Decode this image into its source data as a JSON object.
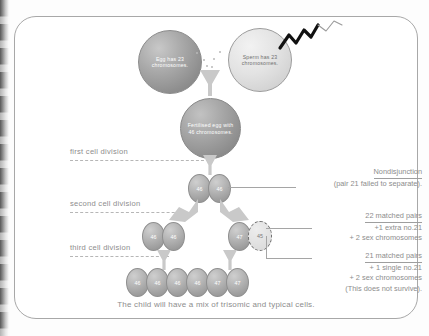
{
  "diagram": {
    "caption": "The child will have a mix of trisomic and typical cells.",
    "gametes": [
      {
        "id": "egg",
        "label": "Egg has 23 chromosomes."
      },
      {
        "id": "sperm",
        "label": "Sperm has 23 chromosomes."
      }
    ],
    "zygote": {
      "label": "Fertilised egg with 46 chromosomes."
    },
    "stage_labels": [
      {
        "id": "first",
        "label": "first cell division"
      },
      {
        "id": "second",
        "label": "second cell division"
      },
      {
        "id": "third",
        "label": "third cell division"
      }
    ],
    "rows": [
      {
        "id": "row-first-division",
        "cells": [
          {
            "value": "46",
            "outline": "solid"
          },
          {
            "value": "46",
            "outline": "solid"
          }
        ]
      },
      {
        "id": "row-second-division-left",
        "cells": [
          {
            "value": "46",
            "outline": "solid"
          },
          {
            "value": "46",
            "outline": "solid"
          }
        ]
      },
      {
        "id": "row-second-division-right",
        "cells": [
          {
            "value": "47",
            "outline": "solid"
          },
          {
            "value": "45",
            "outline": "dashed"
          }
        ]
      },
      {
        "id": "row-third-division",
        "cells": [
          {
            "value": "46",
            "outline": "solid"
          },
          {
            "value": "46",
            "outline": "solid"
          },
          {
            "value": "46",
            "outline": "solid"
          },
          {
            "value": "46",
            "outline": "solid"
          },
          {
            "value": "47",
            "outline": "solid"
          },
          {
            "value": "47",
            "outline": "solid"
          }
        ]
      }
    ],
    "annotations": [
      {
        "id": "nondisjunction",
        "heading": "Nondisjunction",
        "lines": [
          "(pair 21 failed to separate)."
        ]
      },
      {
        "id": "trisomic-cell",
        "heading": "22 matched pairs",
        "lines": [
          "+1 extra no.21",
          "+ 2 sex chromosomes"
        ]
      },
      {
        "id": "monosomic-cell",
        "heading": "21 matched pairs",
        "lines": [
          "+ 1 single no.21",
          "+ 2 sex chromosomes",
          "(This does not survive)."
        ]
      }
    ]
  },
  "colors": {
    "text": "#8d8d8d",
    "frame": "#a8a8a8",
    "cell_fill": "#b4b4b4",
    "dashed_cell": "#e2e2e2",
    "arrow": "#c9c9c9",
    "tail": "#111111"
  }
}
